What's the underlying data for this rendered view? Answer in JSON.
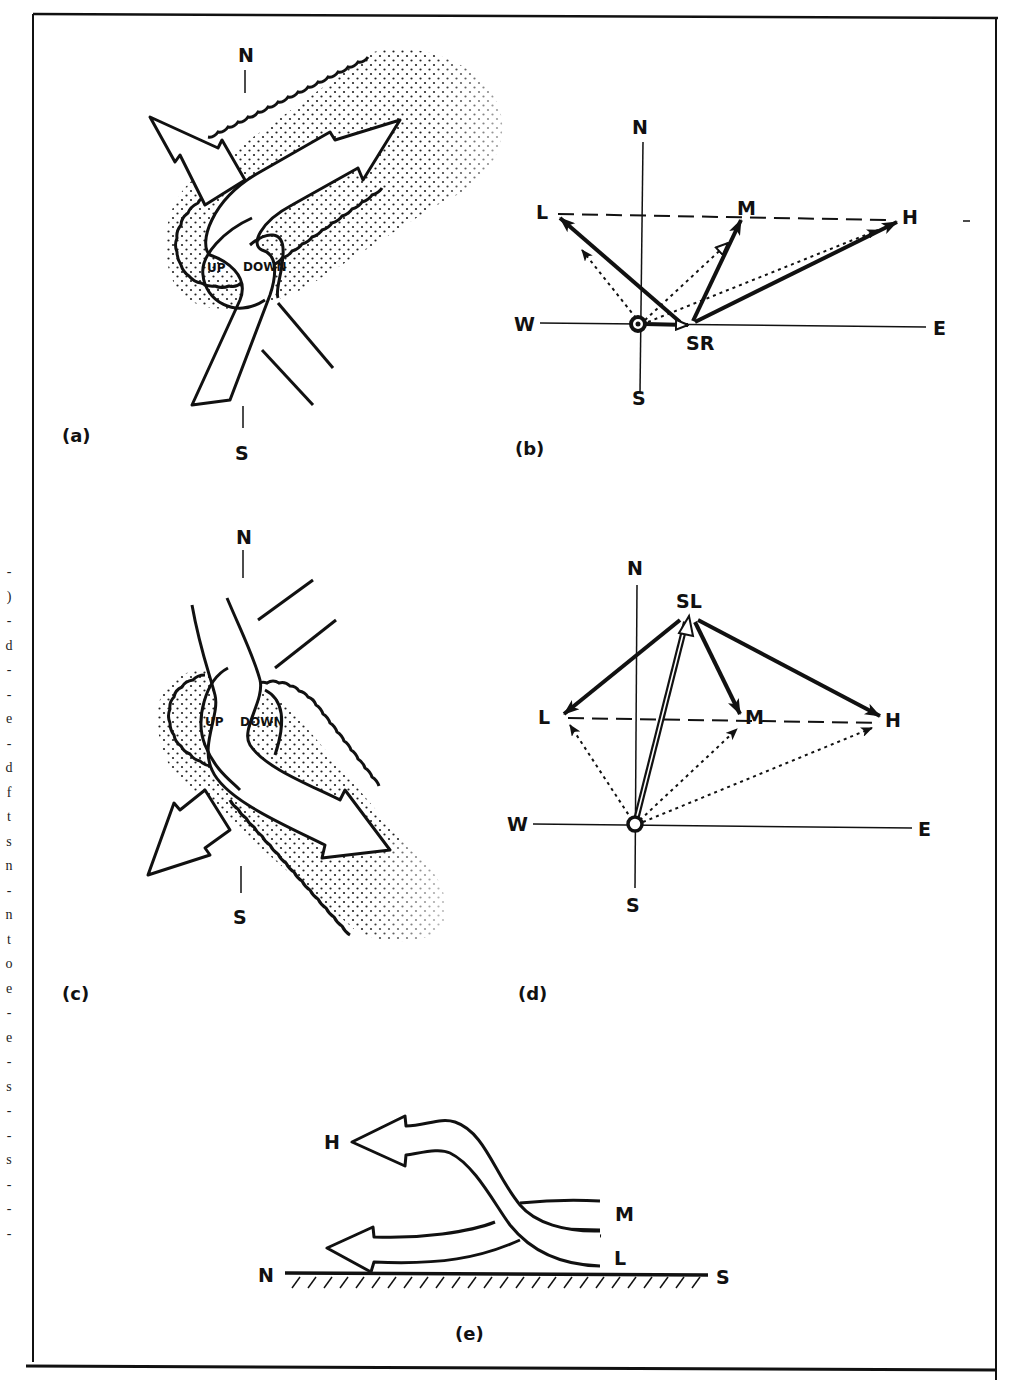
{
  "figure": {
    "frame_color": "#111111",
    "background": "#ffffff",
    "stipple_color": "#222222"
  },
  "margin_text": {
    "characters": [
      "-",
      ")",
      "-",
      "d",
      "-",
      "-",
      "e",
      "-",
      "d",
      "f",
      "t",
      "s",
      "n",
      "-",
      "n",
      "t",
      "o",
      "e",
      "-",
      "e",
      "-",
      "s",
      "-",
      "-",
      "s",
      "-",
      "-",
      "-"
    ]
  },
  "panels": {
    "a": {
      "label": "(a)",
      "north": "N",
      "south": "S",
      "updraft_label": "UP",
      "downdraft_label": "DOWN"
    },
    "b": {
      "label": "(b)",
      "north": "N",
      "south": "S",
      "west": "W",
      "east": "E",
      "points": {
        "low": "L",
        "mid": "M",
        "high": "H",
        "storm_motion": "SR"
      }
    },
    "c": {
      "label": "(c)",
      "north": "N",
      "south": "S",
      "updraft_label": "UP",
      "downdraft_label": "DOWN"
    },
    "d": {
      "label": "(d)",
      "north": "N",
      "south": "S",
      "west": "W",
      "east": "E",
      "points": {
        "low": "L",
        "mid": "M",
        "high": "H",
        "storm_motion": "SL"
      }
    },
    "e": {
      "label": "(e)",
      "north": "N",
      "south": "S",
      "levels": {
        "high": "H",
        "mid": "M",
        "low": "L"
      }
    }
  }
}
